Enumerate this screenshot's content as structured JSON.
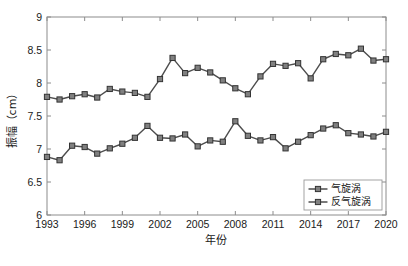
{
  "chart_data": {
    "type": "line",
    "title": "",
    "xlabel": "年份",
    "ylabel": "振幅（cm）",
    "x": [
      1993,
      1994,
      1995,
      1996,
      1997,
      1998,
      1999,
      2000,
      2001,
      2002,
      2003,
      2004,
      2005,
      2006,
      2007,
      2008,
      2009,
      2010,
      2011,
      2012,
      2013,
      2014,
      2015,
      2016,
      2017,
      2018,
      2019,
      2020
    ],
    "xlim": [
      1993,
      2020
    ],
    "ylim": [
      6,
      9
    ],
    "yticks": [
      6,
      6.5,
      7,
      7.5,
      8,
      8.5,
      9
    ],
    "ytick_labels": [
      "6",
      "6.5",
      "7",
      "7.5",
      "8",
      "8.5",
      "9"
    ],
    "xticks": [
      1993,
      1996,
      1999,
      2002,
      2005,
      2008,
      2011,
      2014,
      2017,
      2020
    ],
    "xtick_labels": [
      "1993",
      "1996",
      "1999",
      "2002",
      "2005",
      "2008",
      "2011",
      "2014",
      "2017",
      "2020"
    ],
    "grid": false,
    "legend_position": "lower right",
    "series": [
      {
        "name": "气旋涡",
        "marker": "square",
        "color": "#4d4d4d",
        "values": [
          7.79,
          7.75,
          7.8,
          7.83,
          7.78,
          7.91,
          7.87,
          7.85,
          7.79,
          8.06,
          8.38,
          8.15,
          8.23,
          8.16,
          8.04,
          7.92,
          7.83,
          8.1,
          8.29,
          8.26,
          8.3,
          8.07,
          8.36,
          8.44,
          8.42,
          8.52,
          8.34,
          8.36
        ]
      },
      {
        "name": "反气旋涡",
        "marker": "square",
        "color": "#4d4d4d",
        "values": [
          6.88,
          6.83,
          7.05,
          7.03,
          6.93,
          7.01,
          7.08,
          7.17,
          7.35,
          7.17,
          7.16,
          7.22,
          7.04,
          7.13,
          7.11,
          7.42,
          7.2,
          7.13,
          7.18,
          7.01,
          7.11,
          7.21,
          7.31,
          7.36,
          7.24,
          7.22,
          7.19,
          7.26
        ]
      }
    ]
  },
  "legend": {
    "items": [
      {
        "label": "气旋涡"
      },
      {
        "label": "反气旋涡"
      }
    ]
  },
  "caption": {
    "text": ""
  }
}
